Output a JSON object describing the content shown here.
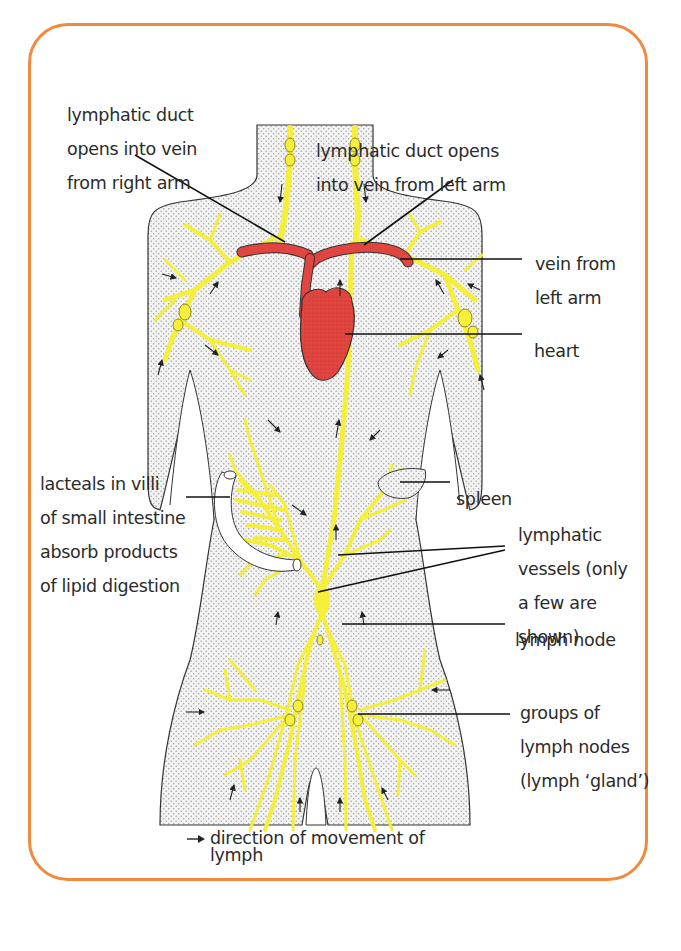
{
  "diagram": {
    "colors": {
      "frame_border": "#ef8a3e",
      "lymph_vessel": "#f5ef3a",
      "vessel_outline": "#7a6f10",
      "blood_vein_heart": "#e0453f",
      "body_fill": "#efefef",
      "label_text": "#2b2b2b",
      "leader_line": "#111111"
    },
    "labels": {
      "duct_right": {
        "lines": [
          "lymphatic duct",
          "opens into vein",
          "from right arm"
        ]
      },
      "duct_left": {
        "lines": [
          "lymphatic duct opens",
          "into vein from left arm"
        ]
      },
      "vein_left_arm": {
        "lines": [
          "vein from",
          "left arm"
        ]
      },
      "heart": {
        "lines": [
          "heart"
        ]
      },
      "lacteals": {
        "lines": [
          "lacteals in villi",
          "of small intestine",
          "absorb products",
          "of lipid digestion"
        ]
      },
      "spleen": {
        "lines": [
          "spleen"
        ]
      },
      "lymphatic_vessels": {
        "lines": [
          "lymphatic",
          "vessels (only",
          "a few are",
          "shown)"
        ]
      },
      "lymph_node": {
        "lines": [
          "lymph node"
        ]
      },
      "lymph_gland": {
        "lines": [
          "groups of",
          "lymph nodes",
          "(lymph ‘gland’)"
        ]
      }
    },
    "legend": {
      "symbol": "arrow-right-icon",
      "lines": [
        "direction of movement of",
        "lymph"
      ]
    },
    "structures": [
      "neck-lymph-nodes",
      "subclavian-vein",
      "heart",
      "thoracic-duct",
      "axillary-lymph-nodes",
      "small-intestine",
      "spleen",
      "cisterna-chyli",
      "inguinal-lymph-nodes"
    ]
  }
}
